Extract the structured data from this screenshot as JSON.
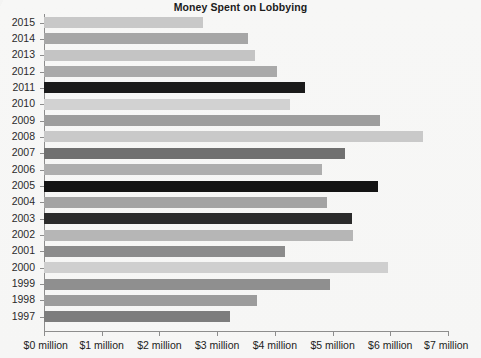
{
  "chart_data": {
    "type": "bar",
    "orientation": "horizontal",
    "title": "Money Spent on Lobbying",
    "xlabel": "",
    "ylabel": "",
    "xlim": [
      0,
      7
    ],
    "xunit": "million dollars",
    "grid": false,
    "legend": null,
    "xticks": [
      {
        "value": 0,
        "label": "$0 million"
      },
      {
        "value": 1,
        "label": "$1 million"
      },
      {
        "value": 2,
        "label": "$2 million"
      },
      {
        "value": 3,
        "label": "$3 million"
      },
      {
        "value": 4,
        "label": "$4 million"
      },
      {
        "value": 5,
        "label": "$5 million"
      },
      {
        "value": 6,
        "label": "$6 million"
      },
      {
        "value": 7,
        "label": "$7 million"
      }
    ],
    "categories": [
      "2015",
      "2014",
      "2013",
      "2012",
      "2011",
      "2010",
      "2009",
      "2008",
      "2007",
      "2006",
      "2005",
      "2004",
      "2003",
      "2002",
      "2001",
      "2000",
      "1999",
      "1998",
      "1997"
    ],
    "values": [
      2.75,
      3.53,
      3.65,
      4.03,
      4.52,
      4.26,
      5.83,
      6.56,
      5.21,
      4.81,
      5.79,
      4.9,
      5.34,
      5.36,
      4.18,
      5.96,
      4.95,
      3.69,
      3.22
    ],
    "bar_colors": [
      "#c8c8c8",
      "#a6a6a6",
      "#c4c4c4",
      "#a9a9a9",
      "#1a1a1a",
      "#d2d2d2",
      "#9d9d9d",
      "#c9c9c9",
      "#707070",
      "#aeaeae",
      "#141414",
      "#a3a3a3",
      "#2b2b2b",
      "#b6b6b6",
      "#8b8b8b",
      "#cfcfcf",
      "#8f8f8f",
      "#9c9c9c",
      "#7d7d7d"
    ]
  }
}
